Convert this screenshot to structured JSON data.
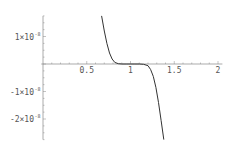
{
  "chart_data": {
    "type": "line",
    "title": "",
    "xlabel": "",
    "ylabel": "",
    "xlim": [
      0,
      2.05
    ],
    "ylim": [
      -2.75e-08,
      1.75e-08
    ],
    "grid": false,
    "legend": null,
    "x_ticks": [
      0.5,
      1,
      1.5,
      2
    ],
    "x_tick_labels": [
      "0.5",
      "1",
      "1.5",
      "2"
    ],
    "y_ticks": [
      1e-08,
      -1e-08,
      -2e-08
    ],
    "y_tick_labels": [
      {
        "mantissa": "1×10",
        "exponent": "-8"
      },
      {
        "mantissa": "-1×10",
        "exponent": "-8"
      },
      {
        "mantissa": "-2×10",
        "exponent": "-8"
      }
    ],
    "series": [
      {
        "name": "f(x)",
        "color": "#333333",
        "x": [
          0.67,
          0.7,
          0.73,
          0.76,
          0.79,
          0.82,
          0.86,
          0.9,
          0.95,
          1.0,
          1.05,
          1.1,
          1.15,
          1.2,
          1.23,
          1.26,
          1.29,
          1.32,
          1.35,
          1.38
        ],
        "y": [
          1.75e-08,
          1.2e-08,
          7.5e-09,
          4e-09,
          1.8e-09,
          6e-10,
          1e-10,
          0,
          0,
          0,
          0,
          0,
          -1e-10,
          -6e-10,
          -2e-09,
          -4.5e-09,
          -8.5e-09,
          -1.4e-08,
          -2.05e-08,
          -2.75e-08
        ]
      }
    ]
  },
  "axes": {
    "color": "#888888"
  }
}
